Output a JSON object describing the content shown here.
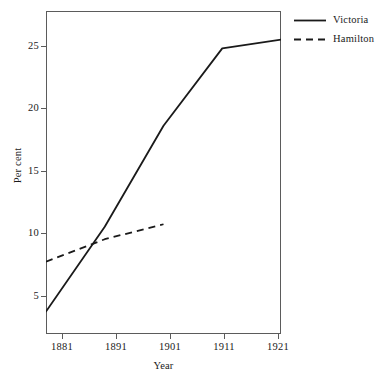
{
  "chart_data": {
    "type": "line",
    "title": "",
    "xlabel": "Year",
    "ylabel": "Per cent",
    "x": [
      1881,
      1891,
      1901,
      1911,
      1921
    ],
    "categories": [
      "1881",
      "1891",
      "1901",
      "1911",
      "1921"
    ],
    "xticklabels": [
      "1881",
      "1891",
      "1901",
      "1911",
      "1921"
    ],
    "yticklabels": [
      "5",
      "10",
      "15",
      "20",
      "25"
    ],
    "yticks": [
      5,
      10,
      15,
      20,
      25
    ],
    "xlim": [
      1881,
      1921
    ],
    "ylim": [
      2.2,
      28.1
    ],
    "grid": false,
    "legend_position": "top-right-outside",
    "series": [
      {
        "name": "Victoria",
        "style": "solid",
        "color": "#1a1a1a",
        "x": [
          1881,
          1891,
          1901,
          1911,
          1921
        ],
        "values": [
          4.0,
          10.8,
          18.9,
          25.1,
          25.8
        ]
      },
      {
        "name": "Hamilton",
        "style": "dashed",
        "color": "#1a1a1a",
        "x": [
          1881,
          1891,
          1901
        ],
        "values": [
          8.0,
          9.8,
          11.0
        ]
      }
    ]
  },
  "legend": {
    "items": [
      {
        "label": "Victoria",
        "style": "solid"
      },
      {
        "label": "Hamilton",
        "style": "dashed"
      }
    ]
  },
  "axes": {
    "y_label": "Per cent",
    "x_label": "Year",
    "y_tick_labels": [
      "25",
      "20",
      "15",
      "10",
      "5"
    ],
    "x_tick_labels": [
      "1881",
      "1891",
      "1901",
      "1911",
      "1921"
    ]
  },
  "colors": {
    "line": "#1a1a1a",
    "frame": "#5b5b5b",
    "background": "#ffffff",
    "text": "#1a1a1a"
  }
}
